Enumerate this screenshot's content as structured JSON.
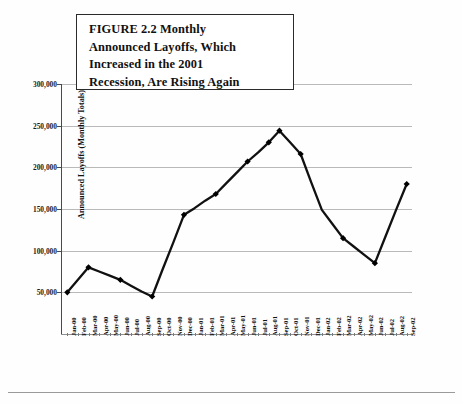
{
  "figure": {
    "title": "FIGURE 2.2  Monthly Announced Layoffs, Which Increased in the 2001 Recession, Are Rising Again",
    "title_lines": [
      "FIGURE 2.2  Monthly",
      "Announced Layoffs, Which",
      "Increased in the 2001",
      "Recession, Are Rising Again"
    ]
  },
  "colors": {
    "line": "#111111",
    "marker": "#000000",
    "grid": "#b9b9b9",
    "axis": "#4a4a4a",
    "text": "#111111",
    "background": "#ffffff"
  },
  "chart_data": {
    "type": "line",
    "title": "FIGURE 2.2  Monthly Announced Layoffs, Which Increased in the 2001 Recession, Are Rising Again",
    "xlabel": "",
    "ylabel": "Announced Layoffs (Monthly Totals)",
    "ylim": [
      0,
      300000
    ],
    "ytick_labels": [
      "300,000",
      "250,000",
      "200,000",
      "150,000",
      "100,000",
      "50,000"
    ],
    "ytick_values": [
      300000,
      250000,
      200000,
      150000,
      100000,
      50000
    ],
    "grid": true,
    "legend": "none",
    "marker": "diamond",
    "categories": [
      "Jan-00",
      "Feb-00",
      "Mar-00",
      "Apr-00",
      "May-00",
      "Jun-00",
      "Jul-00",
      "Aug-00",
      "Sep-00",
      "Oct-00",
      "Nov-00",
      "Dec-00",
      "Jan-01",
      "Feb-01",
      "Mar-01",
      "Apr-01",
      "May-01",
      "Jun-01",
      "Jul-01",
      "Aug-01",
      "Sep-01",
      "Oct-01",
      "Nov-01",
      "Dec-01",
      "Jan-02",
      "Feb-02",
      "Mar-02",
      "Apr-02",
      "May-02",
      "Jun-02",
      "Jul-02",
      "Aug-02",
      "Sep-02"
    ],
    "marked_points": [
      {
        "x": "Jan-00",
        "y": 50000
      },
      {
        "x": "Mar-00",
        "y": 80000
      },
      {
        "x": "Jun-00",
        "y": 65000
      },
      {
        "x": "Sep-00",
        "y": 45000
      },
      {
        "x": "Dec-00",
        "y": 143000
      },
      {
        "x": "Mar-01",
        "y": 168000
      },
      {
        "x": "Jun-01",
        "y": 207000
      },
      {
        "x": "Aug-01",
        "y": 230000
      },
      {
        "x": "Sep-01",
        "y": 244000
      },
      {
        "x": "Nov-01",
        "y": 216000
      },
      {
        "x": "Mar-02",
        "y": 115000
      },
      {
        "x": "Jun-02",
        "y": 85000
      },
      {
        "x": "Sep-02",
        "y": 180000
      }
    ],
    "values": [
      50000,
      65000,
      80000,
      75000,
      70000,
      65000,
      58000,
      51000,
      45000,
      78000,
      110000,
      143000,
      151000,
      160000,
      168000,
      181000,
      194000,
      207000,
      218000,
      230000,
      244000,
      230000,
      216000,
      182000,
      149000,
      132000,
      115000,
      105000,
      95000,
      85000,
      117000,
      149000,
      180000
    ]
  }
}
